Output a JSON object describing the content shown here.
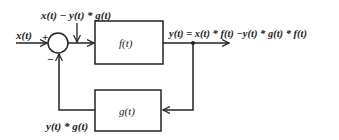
{
  "diagram": {
    "type": "feedback block diagram",
    "input_label": "x(t)",
    "sum_plus": "+",
    "sum_minus": "−",
    "error_label": "x(t) − y(t) * g(t)",
    "forward_block": "f(t)",
    "output_label": "y(t) = x(t) * f(t) −y(t) * g(t) * f(t)",
    "feedback_block": "g(t)",
    "feedback_label": "y(t) * g(t)",
    "colors": {
      "line": "#222222",
      "background": "#ffffff"
    }
  }
}
